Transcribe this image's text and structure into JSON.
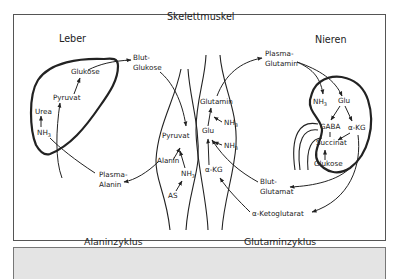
{
  "figure": {
    "organs": {
      "liver": "Leber",
      "muscle": "Skelettmuskel",
      "kidney": "Nieren"
    },
    "liver_labels": {
      "glukose": "Glukose",
      "pyruvat": "Pyruvat",
      "urea": "Urea",
      "nh3": "NH",
      "nh3_sub": "3"
    },
    "blood_labels": {
      "blut_glukose_1": "Blut-",
      "blut_glukose_2": "Glukose",
      "plasma_alanin_1": "Plasma-",
      "plasma_alanin_2": "Alanin",
      "plasma_glutamin_1": "Plasma-",
      "plasma_glutamin_2": "Glutamin",
      "blut_glutamat_1": "Blut-",
      "blut_glutamat_2": "Glutamat",
      "alpha_ketoglutarat": "α-Ketoglutarat"
    },
    "muscle_labels": {
      "pyruvat": "Pyruvat",
      "alanin": "Alanin",
      "nh3": "NH",
      "nh3_sub": "3",
      "as": "AS",
      "glutamin": "Glutamin",
      "glu": "Glu",
      "akg": "α-KG"
    },
    "kidney_labels": {
      "nh3": "NH",
      "nh3_sub": "3",
      "glu": "Glu",
      "gaba": "GABA",
      "akg": "α-KG",
      "succinat": "Succinat",
      "glukose": "Glukose"
    },
    "cycles": {
      "alanine": "Alaninzyklus",
      "glutamine": "Glutaminzyklus"
    }
  }
}
